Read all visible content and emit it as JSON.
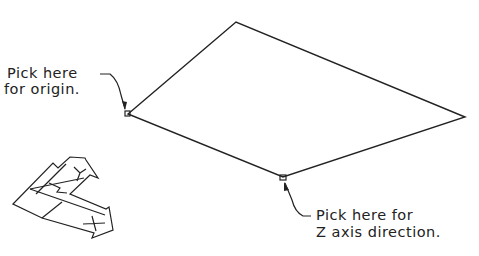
{
  "labels": {
    "origin_line1": "Pick here",
    "origin_line2": "for origin.",
    "zaxis_line1": "Pick here for",
    "zaxis_line2": "Z axis direction."
  },
  "ucs_icon": {
    "x_label": "X",
    "y_label": "Y",
    "w_label": "W"
  },
  "colors": {
    "stroke": "#222222",
    "background": "#ffffff"
  }
}
